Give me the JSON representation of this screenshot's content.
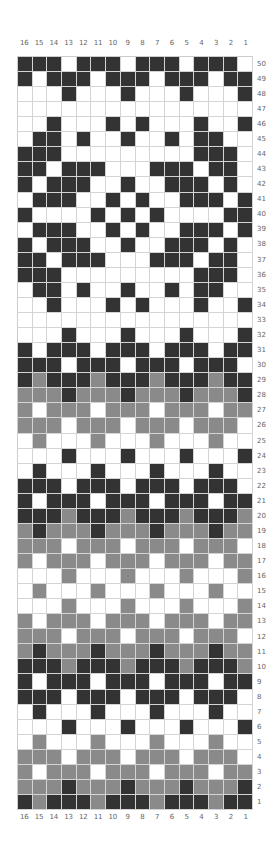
{
  "chart_data": {
    "type": "heatmap",
    "title": "",
    "columns": [
      "16",
      "15",
      "14",
      "13",
      "12",
      "11",
      "10",
      "9",
      "8",
      "7",
      "6",
      "5",
      "4",
      "3",
      "2",
      "1"
    ],
    "rows_top_to_bottom": [
      "50",
      "49",
      "48",
      "47",
      "46",
      "45",
      "44",
      "43",
      "42",
      "41",
      "40",
      "39",
      "38",
      "37",
      "36",
      "35",
      "34",
      "33",
      "32",
      "31",
      "30",
      "29",
      "28",
      "27",
      "26",
      "25",
      "24",
      "23",
      "22",
      "21",
      "20",
      "19",
      "18",
      "17",
      "16",
      "15",
      "14",
      "13",
      "12",
      "11",
      "10",
      "9",
      "8",
      "7",
      "6",
      "5",
      "4",
      "3",
      "2",
      "1"
    ],
    "legend": {
      "D": "dark",
      "G": "gray",
      "W": "white"
    },
    "colors": {
      "D": "#333333",
      "G": "#8a8a8a",
      "W": "#ffffff"
    },
    "grid": [
      "DDDWDDDWDDDWDDDW",
      "DWDDDWDDDWDDDWDD",
      "WWWDWWWDWWWDWWWD",
      "WWWWWWWWWWWWWWWW",
      "WWDWWWDWDWWWDWWD",
      "WDDWDWWDWWDWDDWW",
      "DDDWWWWWWWWWDDDW",
      "DDWDDDWWWDDDWDDW",
      "DWDDDWWDWWDDDWDW",
      "WDDDWWDWDWWDDDWD",
      "DWWWWDWDWDWWWWDD",
      "WDDDWWDWDWWDDDWD",
      "DWDDDWWDWWDDDWDW",
      "DDWDDDWWWDDDWDDW",
      "DDDWWWWWWWWWDDDW",
      "WDDWDWWDWWDWDDWW",
      "WWDWWWDWDWWWDWWD",
      "WWWWWWWWWWWWWWWW",
      "WWWDWWWDWWWDWWWD",
      "DWDDDWDDDWDDDWDD",
      "DDDWDDDWDDDWDDDW",
      "DGDDDGDDDGDDDGDD",
      "GGGDGGGDGGGDGGGD",
      "GWGGGWGGGWGGGWGG",
      "GGGWGGGWGGGWGGGW",
      "WGWWWGWWWGWWWGWW",
      "WWWDWWWDWWWDWWWD",
      "WDWWWDWWWDWWWDWW",
      "DDDWDDDWDDDWDDDW",
      "DWDDDWDDDWDDDWDD",
      "DDDGDDDGDDDGDDDG",
      "GDGGGDGGGDGGGDGG",
      "GGGWGGGWGGGWGGGW",
      "GWGGGWGGGWGGGWGG",
      "WWWGWWWGWWWGWWWG",
      "WGWWWGWWWGWWWGWW",
      "WWWGWWWGWWWGWWWG",
      "GWGGGWGGGWGGGWGG",
      "GGGWGGGWGGGWGGGW",
      "GDGGGDGGGDGGGDGG",
      "DDDGDDDGDDDGDDDG",
      "DWDDDWDDDWDDDWDD",
      "DDDWDDDWDDDWDDDW",
      "WDWWWDWWWDWWWDWW",
      "WWWDWWWDWWWDWWWD",
      "WGWWWGWWWGWWWGWW",
      "GGGWGGGWGGGWGGGW",
      "GWGGGWGGGWGGGWGG",
      "GGGDGGGDGGGDGGGD",
      "DGDDDGDDDGDDDGDD"
    ]
  }
}
